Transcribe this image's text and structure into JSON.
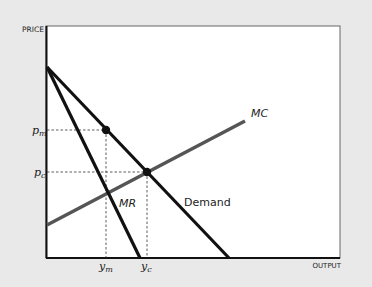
{
  "axes": {
    "y_label": "PRICE",
    "x_label": "OUTPUT"
  },
  "curves": {
    "mc": {
      "label": "MC",
      "color": "#555555"
    },
    "mr": {
      "label": "MR",
      "color": "#111111"
    },
    "demand": {
      "label": "Demand",
      "color": "#111111"
    }
  },
  "ticks": {
    "p_m": {
      "base": "p",
      "sub": "m"
    },
    "p_c": {
      "base": "p",
      "sub": "c"
    },
    "y_m": {
      "base": "y",
      "sub": "m"
    },
    "y_c": {
      "base": "y",
      "sub": "c"
    }
  },
  "colors": {
    "background": "#e9e9e9",
    "plot": "#ffffff",
    "frame": "#666666"
  }
}
